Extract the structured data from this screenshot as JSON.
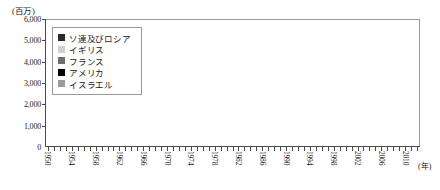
{
  "chart": {
    "type": "bar",
    "unit_label": "(百万)",
    "year_unit_label": "(年)"
  },
  "legend": {
    "items": [
      {
        "label": "ソ連及びロシア",
        "color": "#2b2b2b"
      },
      {
        "label": "イギリス",
        "color": "#d0d0d0"
      },
      {
        "label": "フランス",
        "color": "#6e6e6e"
      },
      {
        "label": "アメリカ",
        "color": "#000000"
      },
      {
        "label": "イスラエル",
        "color": "#9a9a9a"
      }
    ]
  },
  "chart_data": {
    "type": "bar",
    "stacked": true,
    "title": "",
    "subtitle": "",
    "xlabel": "(年)",
    "ylabel": "(百万)",
    "ylim": [
      0,
      6000
    ],
    "yticks": [
      0,
      1000,
      2000,
      3000,
      4000,
      5000,
      6000
    ],
    "ytick_labels": [
      "0",
      "1,000",
      "2,000",
      "3,000",
      "4,000",
      "5,000",
      "6,000"
    ],
    "grid": false,
    "legend_position": "top-left",
    "xlim": [
      1950,
      2012
    ],
    "xtick_labels": [
      "1950",
      "1954",
      "1958",
      "1962",
      "1966",
      "1970",
      "1974",
      "1978",
      "1982",
      "1986",
      "1990",
      "1994",
      "1998",
      "2002",
      "2006",
      "2010"
    ],
    "xtick_step": 4,
    "series": [
      {
        "name": "ソ連及びロシア",
        "color": "#2b2b2b"
      },
      {
        "name": "イギリス",
        "color": "#d0d0d0"
      },
      {
        "name": "フランス",
        "color": "#6e6e6e"
      },
      {
        "name": "アメリカ",
        "color": "#000000"
      },
      {
        "name": "イスラエル",
        "color": "#9a9a9a"
      }
    ],
    "x": [
      1950,
      1951,
      1952,
      1953,
      1954,
      1955,
      1956,
      1957,
      1958,
      1959,
      1960,
      1961,
      1962,
      1963,
      1964,
      1965,
      1966,
      1967,
      1968,
      1969,
      1970,
      1971,
      1972,
      1973,
      1974,
      1975,
      1976,
      1977,
      1978,
      1979,
      1980,
      1981,
      1982,
      1983,
      1984,
      1985,
      1986,
      1987,
      1988,
      1989,
      1990,
      1991,
      1992,
      1993,
      1994,
      1995,
      1996,
      1997,
      1998,
      1999,
      2000,
      2001,
      2002,
      2003,
      2004,
      2005,
      2006,
      2007,
      2008,
      2009,
      2010,
      2011,
      2012
    ],
    "values": [
      {
        "year": 1950,
        "dark": 60,
        "light": 40
      },
      {
        "year": 1951,
        "dark": 80,
        "light": 40
      },
      {
        "year": 1952,
        "dark": 120,
        "light": 60
      },
      {
        "year": 1953,
        "dark": 200,
        "light": 80
      },
      {
        "year": 1954,
        "dark": 260,
        "light": 100
      },
      {
        "year": 1955,
        "dark": 300,
        "light": 120
      },
      {
        "year": 1956,
        "dark": 420,
        "light": 140
      },
      {
        "year": 1957,
        "dark": 540,
        "light": 180
      },
      {
        "year": 1958,
        "dark": 420,
        "light": 760
      },
      {
        "year": 1959,
        "dark": 300,
        "light": 1140
      },
      {
        "year": 1960,
        "dark": 280,
        "light": 1060
      },
      {
        "year": 1961,
        "dark": 260,
        "light": 1080
      },
      {
        "year": 1962,
        "dark": 300,
        "light": 900
      },
      {
        "year": 1963,
        "dark": 340,
        "light": 220
      },
      {
        "year": 1964,
        "dark": 1420,
        "light": 240
      },
      {
        "year": 1965,
        "dark": 420,
        "light": 200
      },
      {
        "year": 1966,
        "dark": 560,
        "light": 240
      },
      {
        "year": 1967,
        "dark": 700,
        "light": 260
      },
      {
        "year": 1968,
        "dark": 900,
        "light": 240
      },
      {
        "year": 1969,
        "dark": 1040,
        "light": 260
      },
      {
        "year": 1970,
        "dark": 1340,
        "light": 280
      },
      {
        "year": 1971,
        "dark": 1460,
        "light": 300
      },
      {
        "year": 1972,
        "dark": 1480,
        "light": 300
      },
      {
        "year": 1973,
        "dark": 1620,
        "light": 320
      },
      {
        "year": 1974,
        "dark": 1780,
        "light": 320
      },
      {
        "year": 1975,
        "dark": 1900,
        "light": 340
      },
      {
        "year": 1976,
        "dark": 2120,
        "light": 340
      },
      {
        "year": 1977,
        "dark": 2320,
        "light": 360
      },
      {
        "year": 1978,
        "dark": 2480,
        "light": 360
      },
      {
        "year": 1979,
        "dark": 2600,
        "light": 380
      },
      {
        "year": 1980,
        "dark": 2740,
        "light": 380
      },
      {
        "year": 1981,
        "dark": 2420,
        "light": 400
      },
      {
        "year": 1982,
        "dark": 2880,
        "light": 400
      },
      {
        "year": 1983,
        "dark": 3100,
        "light": 420
      },
      {
        "year": 1984,
        "dark": 2560,
        "light": 420
      },
      {
        "year": 1985,
        "dark": 2900,
        "light": 440
      },
      {
        "year": 1986,
        "dark": 3800,
        "light": 440
      },
      {
        "year": 1987,
        "dark": 3300,
        "light": 460
      },
      {
        "year": 1988,
        "dark": 2980,
        "light": 460
      },
      {
        "year": 1989,
        "dark": 2200,
        "light": 460
      },
      {
        "year": 1990,
        "dark": 2640,
        "light": 460
      },
      {
        "year": 1991,
        "dark": 3020,
        "light": 440
      },
      {
        "year": 1992,
        "dark": 3240,
        "light": 420
      },
      {
        "year": 1993,
        "dark": 3400,
        "light": 400
      },
      {
        "year": 1994,
        "dark": 2840,
        "light": 380
      },
      {
        "year": 1995,
        "dark": 1260,
        "light": 200
      },
      {
        "year": 1996,
        "dark": 740,
        "light": 140
      },
      {
        "year": 1997,
        "dark": 900,
        "light": 120
      },
      {
        "year": 1998,
        "dark": 1740,
        "light": 140
      },
      {
        "year": 1999,
        "dark": 1160,
        "light": 140
      },
      {
        "year": 2000,
        "dark": 1780,
        "light": 160
      },
      {
        "year": 2001,
        "dark": 1180,
        "light": 160
      },
      {
        "year": 2002,
        "dark": 1000,
        "light": 160
      },
      {
        "year": 2003,
        "dark": 1300,
        "light": 180
      },
      {
        "year": 2004,
        "dark": 900,
        "light": 180
      },
      {
        "year": 2005,
        "dark": 1560,
        "light": 200
      },
      {
        "year": 2006,
        "dark": 2000,
        "light": 200
      },
      {
        "year": 2007,
        "dark": 1840,
        "light": 220
      },
      {
        "year": 2008,
        "dark": 1600,
        "light": 240
      },
      {
        "year": 2009,
        "dark": 1640,
        "light": 240
      },
      {
        "year": 2010,
        "dark": 2380,
        "light": 280
      },
      {
        "year": 2011,
        "dark": 3740,
        "light": 400
      },
      {
        "year": 2012,
        "dark": 4780,
        "light": 620
      }
    ]
  }
}
